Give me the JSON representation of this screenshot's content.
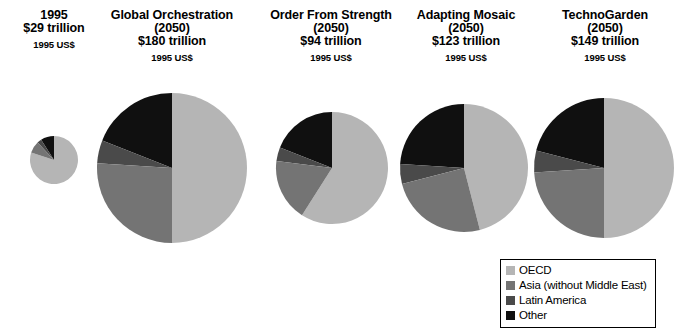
{
  "figure": {
    "background": "#ffffff",
    "units_note": "1995 US$"
  },
  "legend": {
    "name": "region-legend",
    "position": "bottom-right",
    "entries": [
      {
        "label": "OECD",
        "color": "#b5b5b5"
      },
      {
        "label": "Asia (without Middle East)",
        "color": "#747474"
      },
      {
        "label": "Latin America",
        "color": "#4a4a4a"
      },
      {
        "label": "Other",
        "color": "#101010"
      }
    ]
  },
  "panels": [
    {
      "id": "p1995",
      "title": "1995",
      "year": "",
      "value": "$29 trillion",
      "units": "1995 US$",
      "diameter_px": 48,
      "center_x": 54,
      "center_y": 160
    },
    {
      "id": "global-orchestration",
      "title": "Global Orchestration",
      "year": "(2050)",
      "value": "$180 trillion",
      "units": "1995 US$",
      "diameter_px": 150,
      "center_x": 172,
      "center_y": 168
    },
    {
      "id": "order-from-strength",
      "title": "Order From Strength",
      "year": "(2050)",
      "value": "$94 trillion",
      "units": "1995 US$",
      "diameter_px": 112,
      "center_x": 332,
      "center_y": 168
    },
    {
      "id": "adapting-mosaic",
      "title": "Adapting Mosaic",
      "year": "(2050)",
      "value": "$123 trillion",
      "units": "1995 US$",
      "diameter_px": 128,
      "center_x": 464,
      "center_y": 168
    },
    {
      "id": "techno-garden",
      "title": "TechnoGarden",
      "year": "(2050)",
      "value": "$149 trillion",
      "units": "1995 US$",
      "diameter_px": 140,
      "center_x": 604,
      "center_y": 168
    }
  ],
  "chart_data": {
    "type": "pie",
    "subtitle": "1995 US$",
    "note": "Pie area is proportional to total GDP; slice order clockwise from 12 o'clock is OECD, then counter-clockwise Other, Latin America, Asia (without Middle East).",
    "categories": [
      "OECD",
      "Asia (without Middle East)",
      "Latin America",
      "Other"
    ],
    "colors": [
      "#b5b5b5",
      "#747474",
      "#4a4a4a",
      "#101010"
    ],
    "legend_position": "bottom-right",
    "totals_label": "trillion 1995 US$",
    "charts": [
      {
        "name": "1995",
        "year": "1995",
        "total": 29,
        "total_label": "$29 trillion",
        "diameter_px": 48,
        "values": [
          80,
          8,
          3,
          9
        ],
        "unit": "percent"
      },
      {
        "name": "Global Orchestration",
        "year": "2050",
        "total": 180,
        "total_label": "$180 trillion",
        "diameter_px": 150,
        "values": [
          50,
          26,
          5,
          19
        ],
        "unit": "percent"
      },
      {
        "name": "Order From Strength",
        "year": "2050",
        "total": 94,
        "total_label": "$94 trillion",
        "diameter_px": 112,
        "values": [
          59,
          18,
          4,
          19
        ],
        "unit": "percent"
      },
      {
        "name": "Adapting Mosaic",
        "year": "2050",
        "total": 123,
        "total_label": "$123 trillion",
        "diameter_px": 128,
        "values": [
          46,
          25,
          5,
          24
        ],
        "unit": "percent"
      },
      {
        "name": "TechnoGarden",
        "year": "2050",
        "total": 149,
        "total_label": "$149 trillion",
        "diameter_px": 140,
        "values": [
          50,
          24,
          5,
          21
        ],
        "unit": "percent"
      }
    ]
  }
}
